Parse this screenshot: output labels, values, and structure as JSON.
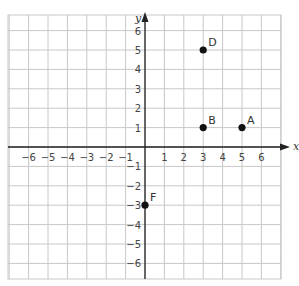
{
  "chart_data": {
    "type": "scatter",
    "title": "",
    "xlabel": "x",
    "ylabel": "y",
    "xlim": [
      -7,
      7
    ],
    "ylim": [
      -7,
      7
    ],
    "grid": true,
    "x_ticks": [
      -6,
      -5,
      -4,
      -3,
      -2,
      -1,
      1,
      2,
      3,
      4,
      5,
      6
    ],
    "y_ticks": [
      6,
      5,
      4,
      3,
      2,
      1,
      -1,
      -2,
      -3,
      -4,
      -5,
      -6
    ],
    "points": [
      {
        "label": "A",
        "x": 5,
        "y": 1
      },
      {
        "label": "B",
        "x": 3,
        "y": 1
      },
      {
        "label": "D",
        "x": 3,
        "y": 5
      },
      {
        "label": "F",
        "x": 0,
        "y": -3
      }
    ]
  },
  "colors": {
    "grid": "#c8c8c8",
    "axis": "#222222",
    "point": "#111111",
    "text": "#444444"
  }
}
